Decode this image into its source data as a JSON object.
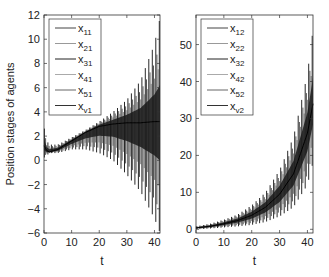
{
  "chart_data": [
    {
      "type": "line",
      "title": "",
      "xlabel": "t",
      "ylabel": "Position stages of agents",
      "xlim": [
        0,
        42
      ],
      "ylim": [
        -6,
        12
      ],
      "xticks": [
        0,
        10,
        20,
        30,
        40
      ],
      "yticks": [
        -6,
        -4,
        -2,
        0,
        2,
        4,
        6,
        8,
        10,
        12
      ],
      "grid": false,
      "legend_position": "upper-left",
      "series": [
        {
          "name": "x11",
          "label_base": "x",
          "label_sub": "11"
        },
        {
          "name": "x21",
          "label_base": "x",
          "label_sub": "21"
        },
        {
          "name": "x31",
          "label_base": "x",
          "label_sub": "31"
        },
        {
          "name": "x41",
          "label_base": "x",
          "label_sub": "41"
        },
        {
          "name": "x51",
          "label_base": "x",
          "label_sub": "51"
        },
        {
          "name": "xv1",
          "label_base": "x",
          "label_sub": "v1"
        }
      ],
      "envelope": {
        "t": [
          0,
          1,
          2,
          5,
          10,
          15,
          20,
          25,
          30,
          35,
          40,
          42
        ],
        "upper": [
          2.8,
          1.6,
          1.3,
          1.3,
          1.9,
          2.5,
          3.2,
          4.0,
          5.0,
          6.6,
          9.6,
          11.8
        ],
        "lower": [
          0.2,
          0.4,
          0.6,
          0.6,
          0.9,
          0.9,
          0.6,
          0.0,
          -1.2,
          -2.6,
          -4.8,
          -6.0
        ],
        "center": [
          1.2,
          0.8,
          0.7,
          0.9,
          1.6,
          2.3,
          2.8,
          3.0,
          3.1,
          3.1,
          3.2,
          3.2
        ]
      }
    },
    {
      "type": "line",
      "title": "",
      "xlabel": "t",
      "ylabel": "",
      "xlim": [
        0,
        42
      ],
      "ylim": [
        -1,
        58
      ],
      "xticks": [
        0,
        10,
        20,
        30,
        40
      ],
      "yticks": [
        0,
        10,
        20,
        30,
        40,
        50
      ],
      "grid": false,
      "legend_position": "upper-left",
      "series": [
        {
          "name": "x12",
          "label_base": "x",
          "label_sub": "12"
        },
        {
          "name": "x22",
          "label_base": "x",
          "label_sub": "22"
        },
        {
          "name": "x32",
          "label_base": "x",
          "label_sub": "32"
        },
        {
          "name": "x42",
          "label_base": "x",
          "label_sub": "42"
        },
        {
          "name": "x52",
          "label_base": "x",
          "label_sub": "52"
        },
        {
          "name": "xv2",
          "label_base": "x",
          "label_sub": "v2"
        }
      ],
      "envelope": {
        "t": [
          0,
          5,
          10,
          15,
          20,
          25,
          30,
          35,
          40,
          42
        ],
        "upper": [
          0.8,
          1.5,
          2.6,
          4.0,
          6.5,
          10.0,
          16.0,
          25.0,
          42.0,
          54.0
        ],
        "lower": [
          0.0,
          0.2,
          0.5,
          0.8,
          1.2,
          2.0,
          3.5,
          6.0,
          12.0,
          18.0
        ],
        "center": [
          0.4,
          0.8,
          1.5,
          2.4,
          3.8,
          6.0,
          9.5,
          15.0,
          26.0,
          34.0
        ]
      }
    }
  ]
}
